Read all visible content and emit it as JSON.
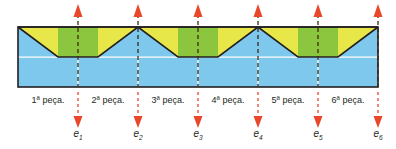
{
  "diagram": {
    "colors": {
      "blue_fill": "#7ec8ee",
      "blue_grid": "#ffffff",
      "green_fill": "#8cc63f",
      "yellow_fill": "#e8e74a",
      "outline": "#231f20",
      "marker_red": "#e8472a",
      "dash_dark": "#3a2a18"
    },
    "piece_labels": [
      "1ª peça.",
      "2ª peça.",
      "3ª peça.",
      "4ª peça.",
      "5ª peça.",
      "6ª peça."
    ],
    "cut_markers": [
      {
        "name": "e",
        "sub": "1"
      },
      {
        "name": "e",
        "sub": "2"
      },
      {
        "name": "e",
        "sub": "3"
      },
      {
        "name": "e",
        "sub": "4"
      },
      {
        "name": "e",
        "sub": "5"
      },
      {
        "name": "e",
        "sub": "6"
      }
    ]
  }
}
